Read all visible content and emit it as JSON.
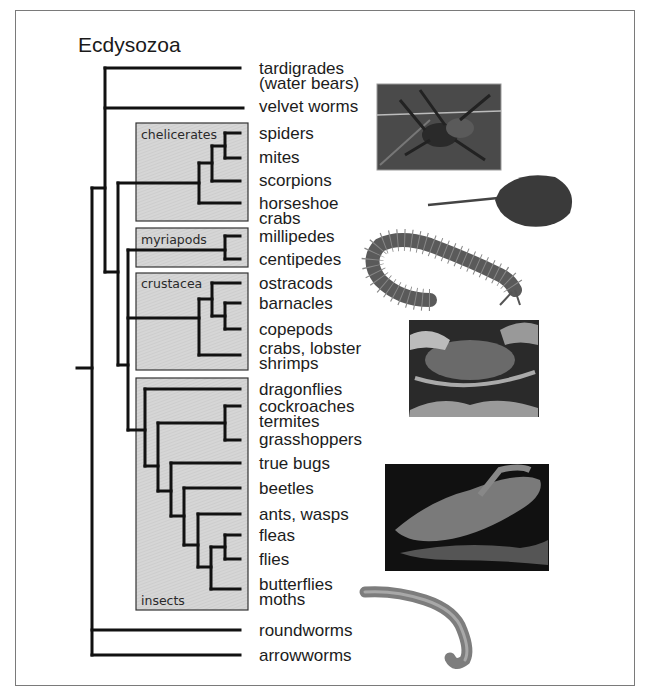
{
  "title": "Ecdysozoa",
  "clades": [
    {
      "id": "chelicerates",
      "label": "chelicerates"
    },
    {
      "id": "myriapods",
      "label": "myriapods"
    },
    {
      "id": "crustacea",
      "label": "crustacea"
    },
    {
      "id": "insects",
      "label": "insects"
    }
  ],
  "leaves": [
    {
      "label": "tardigrades\n(water bears)",
      "y": 61
    },
    {
      "label": "velvet worms",
      "y": 99
    },
    {
      "label": "spiders",
      "y": 126
    },
    {
      "label": "mites",
      "y": 150
    },
    {
      "label": "scorpions",
      "y": 173
    },
    {
      "label": "horseshoe\ncrabs",
      "y": 196
    },
    {
      "label": "millipedes",
      "y": 229
    },
    {
      "label": "centipedes",
      "y": 252
    },
    {
      "label": "ostracods",
      "y": 276
    },
    {
      "label": "barnacles",
      "y": 296
    },
    {
      "label": "copepods",
      "y": 322
    },
    {
      "label": "crabs, lobster\nshrimps",
      "y": 341
    },
    {
      "label": "dragonflies",
      "y": 382
    },
    {
      "label": "cockroaches\ntermites",
      "y": 399
    },
    {
      "label": "grasshoppers",
      "y": 432
    },
    {
      "label": "true bugs",
      "y": 456
    },
    {
      "label": "beetles",
      "y": 481
    },
    {
      "label": "ants, wasps",
      "y": 507
    },
    {
      "label": "fleas",
      "y": 528
    },
    {
      "label": "flies",
      "y": 552
    },
    {
      "label": "butterflies\nmoths",
      "y": 577
    },
    {
      "label": "roundworms",
      "y": 623
    },
    {
      "label": "arrowworms",
      "y": 648
    }
  ],
  "photos": [
    {
      "name": "spider-photo",
      "subject": "spider"
    },
    {
      "name": "horseshoe-crab-photo",
      "subject": "horseshoe crab"
    },
    {
      "name": "centipede-photo",
      "subject": "centipede"
    },
    {
      "name": "crab-photo",
      "subject": "crab"
    },
    {
      "name": "butterfly-photo",
      "subject": "butterfly"
    },
    {
      "name": "roundworm-photo",
      "subject": "roundworm"
    }
  ],
  "colors": {
    "clade_box_fill": "#d4d4d4",
    "line": "#111111",
    "frame": "#7a7a7a"
  }
}
